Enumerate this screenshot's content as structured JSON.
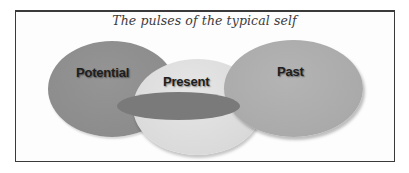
{
  "diagram": {
    "title": "The pulses of the typical self",
    "type": "overlapping-ellipses",
    "circles": [
      {
        "id": "potential",
        "label": "Potential",
        "color": "#8e8e8e"
      },
      {
        "id": "present",
        "label": "Present",
        "color": "#dcdcdc"
      },
      {
        "id": "past",
        "label": "Past",
        "color": "#adadad"
      }
    ],
    "overlap_band": {
      "color": "#7a7a7a"
    },
    "frame": {
      "border_color": "#3a3a3a",
      "background": "#fdfdfd"
    }
  }
}
